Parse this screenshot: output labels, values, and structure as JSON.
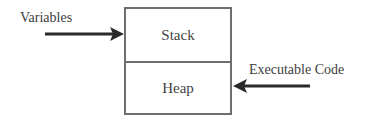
{
  "diagram": {
    "blocks": [
      {
        "id": "stack",
        "label": "Stack"
      },
      {
        "id": "heap",
        "label": "Heap"
      }
    ],
    "arrows": [
      {
        "label": "Variables",
        "target": "stack",
        "direction": "left-to-right"
      },
      {
        "label": "Executable Code",
        "target": "heap",
        "direction": "right-to-left"
      }
    ],
    "colors": {
      "border": "#6e6e6e",
      "arrow": "#2a2a2a",
      "text": "#3d3d3d"
    }
  }
}
